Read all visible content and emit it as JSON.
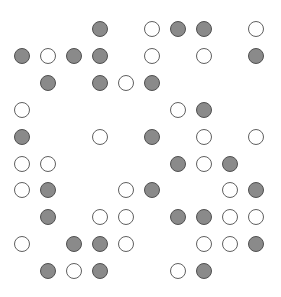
{
  "grid": {
    "rows": 10,
    "cols": 10,
    "origin_x": 22,
    "origin_y": 29,
    "step_x": 26,
    "step_y": 26.9,
    "colors": {
      "filled": "#8a8a8a",
      "filled_border": "#505050",
      "open": "#ffffff",
      "open_border": "#606060"
    },
    "cells": [
      "...F.OFF.O",
      "FOFF.O.O.F",
      ".F.FOF....",
      "O.....OF..",
      "F..O.F.O.O",
      "OO....FOF.",
      "OF..OF..OF",
      ".F.OO.FFOO",
      "O.FFO..OOF",
      ".FOF..OF.."
    ],
    "legend": {
      "F": "filled-circle",
      "O": "open-circle",
      ".": "empty"
    }
  }
}
